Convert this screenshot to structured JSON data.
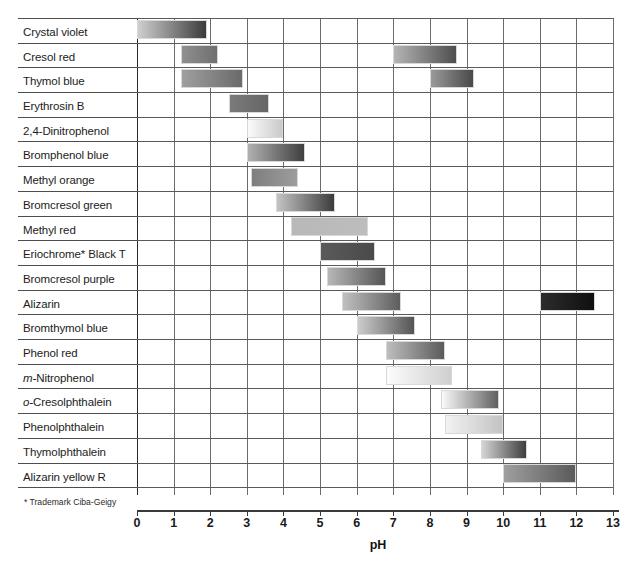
{
  "chart_data": {
    "type": "bar",
    "orientation": "horizontal-range",
    "title": "",
    "xlabel": "pH",
    "ylabel": "",
    "xlim": [
      0,
      13
    ],
    "xticks": [
      "0",
      "1",
      "2",
      "3",
      "4",
      "5",
      "6",
      "7",
      "8",
      "9",
      "10",
      "11",
      "12",
      "13"
    ],
    "grid": true,
    "legend": null,
    "footnote": "* Trademark Ciba-Geigy",
    "categories": [
      "Crystal violet",
      "Cresol red",
      "Thymol blue",
      "Erythrosin B",
      "2,4-Dinitrophenol",
      "Bromphenol blue",
      "Methyl orange",
      "Bromcresol green",
      "Methyl red",
      "Eriochrome* Black T",
      "Bromcresol purple",
      "Alizarin",
      "Bromthymol blue",
      "Phenol red",
      "m-Nitrophenol",
      "o-Cresolphthalein",
      "Phenolphthalein",
      "Thymolphthalein",
      "Alizarin yellow R"
    ],
    "rows": [
      {
        "label": "Crystal violet",
        "italic_prefix": "",
        "bands": [
          {
            "start": 0.0,
            "end": 1.9,
            "from": "#cfcfcf",
            "to": "#3b3b3b"
          }
        ]
      },
      {
        "label": "Cresol red",
        "italic_prefix": "",
        "bands": [
          {
            "start": 1.2,
            "end": 2.2,
            "from": "#8f8f8f",
            "to": "#6f6f6f"
          },
          {
            "start": 7.0,
            "end": 8.75,
            "from": "#b4b4b4",
            "to": "#4e4e4e"
          }
        ]
      },
      {
        "label": "Thymol blue",
        "italic_prefix": "",
        "bands": [
          {
            "start": 1.2,
            "end": 2.9,
            "from": "#9f9f9f",
            "to": "#6a6a6a"
          },
          {
            "start": 8.0,
            "end": 9.2,
            "from": "#9a9a9a",
            "to": "#494949"
          }
        ]
      },
      {
        "label": "Erythrosin B",
        "italic_prefix": "",
        "bands": [
          {
            "start": 2.5,
            "end": 3.6,
            "from": "#7a7a7a",
            "to": "#666666"
          }
        ]
      },
      {
        "label": "2,4-Dinitrophenol",
        "italic_prefix": "",
        "bands": [
          {
            "start": 3.0,
            "end": 4.0,
            "from": "#fbfbfb",
            "to": "#c9c9c9"
          }
        ]
      },
      {
        "label": "Bromphenol blue",
        "italic_prefix": "",
        "bands": [
          {
            "start": 3.0,
            "end": 4.6,
            "from": "#b0b0b0",
            "to": "#3f3f3f"
          }
        ]
      },
      {
        "label": "Methyl orange",
        "italic_prefix": "",
        "bands": [
          {
            "start": 3.1,
            "end": 4.4,
            "from": "#7e7e7e",
            "to": "#9d9d9d"
          }
        ]
      },
      {
        "label": "Bromcresol green",
        "italic_prefix": "",
        "bands": [
          {
            "start": 3.8,
            "end": 5.4,
            "from": "#c4c4c4",
            "to": "#3c3c3c"
          }
        ]
      },
      {
        "label": "Methyl red",
        "italic_prefix": "",
        "bands": [
          {
            "start": 4.2,
            "end": 6.3,
            "from": "#b8b8b8",
            "to": "#bdbdbd"
          }
        ]
      },
      {
        "label": "Eriochrome* Black T",
        "italic_prefix": "",
        "bands": [
          {
            "start": 5.0,
            "end": 6.5,
            "from": "#5a5a5a",
            "to": "#4a4a4a"
          }
        ]
      },
      {
        "label": "Bromcresol purple",
        "italic_prefix": "",
        "bands": [
          {
            "start": 5.2,
            "end": 6.8,
            "from": "#b7b7b7",
            "to": "#555555"
          }
        ]
      },
      {
        "label": "Alizarin",
        "italic_prefix": "",
        "bands": [
          {
            "start": 5.6,
            "end": 7.2,
            "from": "#c0c0c0",
            "to": "#5d5d5d"
          },
          {
            "start": 11.0,
            "end": 12.5,
            "from": "#2c2c2c",
            "to": "#101010"
          }
        ]
      },
      {
        "label": "Bromthymol blue",
        "italic_prefix": "",
        "bands": [
          {
            "start": 6.0,
            "end": 7.6,
            "from": "#cccccc",
            "to": "#545454"
          }
        ]
      },
      {
        "label": "Phenol red",
        "italic_prefix": "",
        "bands": [
          {
            "start": 6.8,
            "end": 8.4,
            "from": "#bdbdbd",
            "to": "#5b5b5b"
          }
        ]
      },
      {
        "label": "Nitrophenol",
        "italic_prefix": "m-",
        "bands": [
          {
            "start": 6.8,
            "end": 8.6,
            "from": "#fcfcfc",
            "to": "#cfcfcf"
          }
        ]
      },
      {
        "label": "Cresolphthalein",
        "italic_prefix": "o-",
        "bands": [
          {
            "start": 8.3,
            "end": 9.9,
            "from": "#fafafa",
            "to": "#5f5f5f"
          }
        ]
      },
      {
        "label": "Phenolphthalein",
        "italic_prefix": "",
        "bands": [
          {
            "start": 8.4,
            "end": 10.0,
            "from": "#f2f2f2",
            "to": "#c3c3c3"
          }
        ]
      },
      {
        "label": "Thymolphthalein",
        "italic_prefix": "",
        "bands": [
          {
            "start": 9.4,
            "end": 10.65,
            "from": "#d4d4d4",
            "to": "#3e3e3e"
          }
        ]
      },
      {
        "label": "Alizarin yellow R",
        "italic_prefix": "",
        "bands": [
          {
            "start": 10.0,
            "end": 12.0,
            "from": "#9f9f9f",
            "to": "#5a5a5a"
          }
        ]
      }
    ]
  },
  "axis": {
    "title": "pH",
    "footnote": "* Trademark Ciba-Geigy"
  }
}
